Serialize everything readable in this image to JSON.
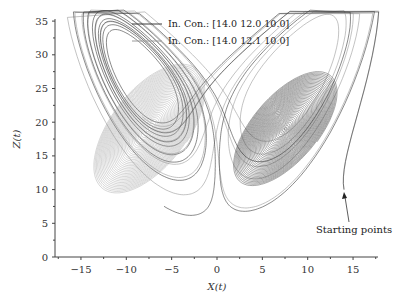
{
  "chart_data": {
    "type": "line",
    "title": "",
    "xlabel": "X(t)",
    "ylabel": "Z(t)",
    "xlim": [
      -18,
      18.5
    ],
    "ylim": [
      0,
      35
    ],
    "x_ticks": [
      -15,
      -10,
      -5,
      0,
      5,
      10,
      15
    ],
    "x_tick_labels": [
      "−15",
      "−10",
      "−5",
      "0",
      "5",
      "10",
      "15"
    ],
    "y_ticks": [
      0,
      5,
      10,
      15,
      20,
      25,
      30,
      35
    ],
    "y_tick_labels": [
      "0",
      "5",
      "10",
      "15",
      "20",
      "25",
      "30",
      "35"
    ],
    "grid": false,
    "legend_position": "upper center",
    "system": "Lorenz attractor (sigma=10, rho=28, beta=8/3), X-Z projection",
    "series": [
      {
        "name": "In. Con.: [14.0 12.0 10.0]",
        "initial_condition": [
          14.0,
          12.0,
          10.0
        ],
        "color": "#3a3a3a",
        "description": "converges to right lobe spiral centered near (7.5, 19)"
      },
      {
        "name": "In. Con.: [14.0 12.1 10.0]",
        "initial_condition": [
          14.0,
          12.1,
          10.0
        ],
        "color": "#9a9a9a",
        "description": "converges to left lobe spiral centered near (-7.5, 19)"
      }
    ],
    "annotations": [
      {
        "text": "Starting points",
        "x": 15.5,
        "z": 5.5,
        "arrow_to": [
          14.0,
          10.0
        ]
      }
    ]
  },
  "legend": {
    "items": [
      {
        "label": "In. Con.: [14.0 12.0 10.0]",
        "color": "#3a3a3a"
      },
      {
        "label": "In. Con.: [14.0 12.1 10.0]",
        "color": "#9a9a9a"
      }
    ]
  },
  "annotation": {
    "label": "Starting points"
  },
  "axes": {
    "xlabel": "X(t)",
    "ylabel": "Z(t)"
  }
}
